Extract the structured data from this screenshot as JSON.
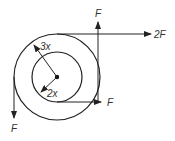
{
  "diagram": {
    "center": {
      "x": 57,
      "y": 77
    },
    "outer_circle": {
      "radius_label": "3x",
      "r": 43
    },
    "inner_circle": {
      "radius_label": "2x",
      "r": 25
    },
    "forces": [
      {
        "label": "F",
        "direction": "down",
        "location": "left edge of outer circle"
      },
      {
        "label": "F",
        "direction": "up",
        "location": "right edge of outer circle"
      },
      {
        "label": "2F",
        "direction": "right",
        "location": "top of outer circle"
      },
      {
        "label": "F",
        "direction": "right",
        "location": "bottom of inner circle"
      }
    ],
    "labels": {
      "outer_radius": "3x",
      "inner_radius": "2x",
      "force_left_down": "F",
      "force_top_up": "F",
      "force_top_right": "2F",
      "force_bottom_right": "F"
    },
    "colors": {
      "stroke": "#222222",
      "background": "#ffffff"
    }
  }
}
